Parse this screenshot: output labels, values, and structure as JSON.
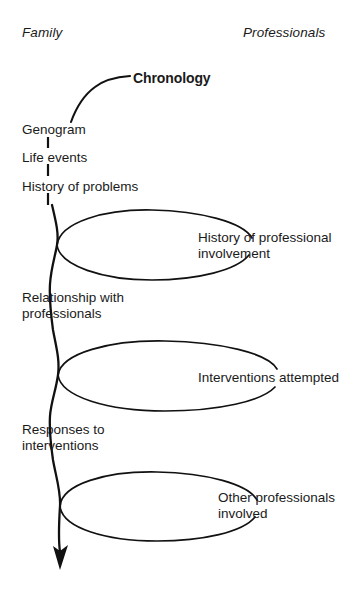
{
  "diagram": {
    "title_label": "Chronology",
    "columns": {
      "left_heading": "Family",
      "right_heading": "Professionals"
    },
    "family_nodes": [
      {
        "label": "Genogram"
      },
      {
        "label": "Life events"
      },
      {
        "label": "History of problems"
      },
      {
        "label": "Relationship with\nprofessionals"
      },
      {
        "label": "Responses to\ninterventions"
      }
    ],
    "professional_nodes": [
      {
        "label": "History of professional\ninvolvement"
      },
      {
        "label": "Interventions attempted"
      },
      {
        "label": "Other professionals\ninvolved"
      }
    ],
    "colors": {
      "ink": "#111111",
      "background": "#ffffff"
    }
  }
}
